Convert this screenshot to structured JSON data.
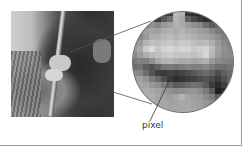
{
  "figure": {
    "label": "pixel",
    "photo_alt": "grayscale photo of person in fringed clothing holding a rifle",
    "magnifier_pixels": [
      [
        "#a8a8a8",
        "#a8a8a8",
        "#a0a0a0",
        "#3a3a3a",
        "#2a2a2a",
        "#303030",
        "#3c3c3c",
        "#b8b8b8",
        "#b0b0b0",
        "#383838",
        "#2c2c2c",
        "#262626",
        "#2e2e2e",
        "#9c9c9c",
        "#9c9c9c",
        "#a0a0a0",
        "#a0a0a0"
      ],
      [
        "#a0a0a0",
        "#9a9a9a",
        "#4a4a4a",
        "#505050",
        "#3c3c3c",
        "#5a5a5a",
        "#707070",
        "#b4b4b4",
        "#a8a8a8",
        "#606060",
        "#4a4a4a",
        "#3a3a3a",
        "#2e2e2e",
        "#383838",
        "#8e8e8e",
        "#9a9a9a",
        "#9a9a9a"
      ],
      [
        "#9a9a9a",
        "#8c8c8c",
        "#8a8a8a",
        "#909090",
        "#868686",
        "#989898",
        "#a2a2a2",
        "#b0b0b0",
        "#aaaaaa",
        "#9a9a9a",
        "#8e8e8e",
        "#868686",
        "#6e6e6e",
        "#5a5a5a",
        "#686868",
        "#8a8a8a",
        "#969696"
      ],
      [
        "#8e8e8e",
        "#8a8a8a",
        "#9c9c9c",
        "#a4a4a4",
        "#a0a0a0",
        "#acacac",
        "#b2b2b2",
        "#acacac",
        "#b4b4b4",
        "#aaaaaa",
        "#a6a6a6",
        "#9e9e9e",
        "#9a9a9a",
        "#8a8a8a",
        "#7c7c7c",
        "#7a7a7a",
        "#8a8a8a"
      ],
      [
        "#7e7e7e",
        "#888888",
        "#9a9a9a",
        "#aeaeae",
        "#b0b0b0",
        "#b8b8b8",
        "#bcbcbc",
        "#b4b4b4",
        "#bababa",
        "#b6b6b6",
        "#b2b2b2",
        "#a8a8a8",
        "#a4a4a4",
        "#9c9c9c",
        "#8e8e8e",
        "#808080",
        "#7c7c7c"
      ],
      [
        "#8a8a8a",
        "#9a9a9a",
        "#b4b4b4",
        "#c0c0c0",
        "#bcbcbc",
        "#c4c4c4",
        "#c8c8c8",
        "#c2c2c2",
        "#cacaca",
        "#c6c6c6",
        "#bebebe",
        "#b8b8b8",
        "#bcbcbc",
        "#aeaeae",
        "#989898",
        "#8a8a8a",
        "#828282"
      ],
      [
        "#9a9a9a",
        "#a8a8a8",
        "#cacaca",
        "#dcdcdc",
        "#c6c6c6",
        "#d2d2d2",
        "#d8d8d8",
        "#d0d0d0",
        "#d6d6d6",
        "#d4d4d4",
        "#c8c8c8",
        "#cecece",
        "#d4d4d4",
        "#bcbcbc",
        "#a0a0a0",
        "#909090",
        "#888888"
      ],
      [
        "#8c8c8c",
        "#9c9c9c",
        "#aeaeae",
        "#b8b8b8",
        "#c0c0c0",
        "#c8c8c8",
        "#cccccc",
        "#c6c6c6",
        "#c4c4c4",
        "#c6c6c6",
        "#bebebe",
        "#c8c8c8",
        "#d6d6d6",
        "#b6b6b6",
        "#9a9a9a",
        "#8e8e8e",
        "#8a8a8a"
      ],
      [
        "#7a7a7a",
        "#808080",
        "#7e7e7e",
        "#8e8e8e",
        "#a6a6a6",
        "#b2b2b2",
        "#b4b4b4",
        "#aeaeae",
        "#a8a8a8",
        "#acacac",
        "#a6a6a6",
        "#aaaaaa",
        "#b0b0b0",
        "#9a9a9a",
        "#8a8a8a",
        "#858585",
        "#828282"
      ],
      [
        "#6c6c6c",
        "#727272",
        "#5e5e5e",
        "#545454",
        "#626262",
        "#767676",
        "#7a7a7a",
        "#747474",
        "#7c7c7c",
        "#848484",
        "#7e7e7e",
        "#808080",
        "#868686",
        "#7a7a7a",
        "#6e6e6e",
        "#6e6e6e",
        "#767676"
      ],
      [
        "#8a8a8a",
        "#868686",
        "#6e6e6e",
        "#545454",
        "#3e3e3e",
        "#3a3a3a",
        "#424242",
        "#3e3e3e",
        "#444444",
        "#4e4e4e",
        "#5a5a5a",
        "#646464",
        "#6a6a6a",
        "#626262",
        "#4e4e4e",
        "#5e5e5e",
        "#6a6a6a"
      ],
      [
        "#9a9a9a",
        "#a0a0a0",
        "#929292",
        "#7c7c7c",
        "#6a6a6a",
        "#505050",
        "#383838",
        "#2e2e2e",
        "#343434",
        "#3c3c3c",
        "#424242",
        "#4c4c4c",
        "#545454",
        "#4a4a4a",
        "#3c3c3c",
        "#505050",
        "#666666"
      ],
      [
        "#a2a2a2",
        "#a8a8a8",
        "#a4a4a4",
        "#989898",
        "#8e8e8e",
        "#7c7c7c",
        "#6c6c6c",
        "#5a5a5a",
        "#5e5e5e",
        "#6a6a6a",
        "#727272",
        "#6e6e6e",
        "#5a5a5a",
        "#3a3a3a",
        "#2c2c2c",
        "#3e3e3e",
        "#585858"
      ],
      [
        "#a6a6a6",
        "#aaaaaa",
        "#acacac",
        "#a8a8a8",
        "#a2a2a2",
        "#9a9a9a",
        "#929292",
        "#8a8a8a",
        "#8e8e8e",
        "#949494",
        "#969696",
        "#8c8c8c",
        "#7a7a7a",
        "#5c5c5c",
        "#1e1e1e",
        "#2a2a2a",
        "#4a4a4a"
      ],
      [
        "#a8a8a8",
        "#acacac",
        "#b0b0b0",
        "#aeaeae",
        "#a6a6a6",
        "#a2a2a2",
        "#9e9e9e",
        "#a6a6a6",
        "#b4b4b4",
        "#a4a4a4",
        "#9e9e9e",
        "#9a9a9a",
        "#8c8c8c",
        "#7a7a7a",
        "#5a5a5a",
        "#4a4a4a",
        "#5a5a5a"
      ],
      [
        "#aaaaaa",
        "#aeaeae",
        "#b0b0b0",
        "#acacac",
        "#a8a8a8",
        "#a6a6a6",
        "#a2a2a2",
        "#a4a4a4",
        "#a8a8a8",
        "#a6a6a6",
        "#a2a2a2",
        "#9e9e9e",
        "#969696",
        "#8a8a8a",
        "#7e7e7e",
        "#7a7a7a",
        "#828282"
      ],
      [
        "#acacac",
        "#b0b0b0",
        "#b2b2b2",
        "#aeaeae",
        "#aaaaaa",
        "#a8a8a8",
        "#a6a6a6",
        "#a6a6a6",
        "#a8a8a8",
        "#a8a8a8",
        "#a4a4a4",
        "#a0a0a0",
        "#9c9c9c",
        "#969696",
        "#8e8e8e",
        "#8a8a8a",
        "#8e8e8e"
      ]
    ]
  }
}
